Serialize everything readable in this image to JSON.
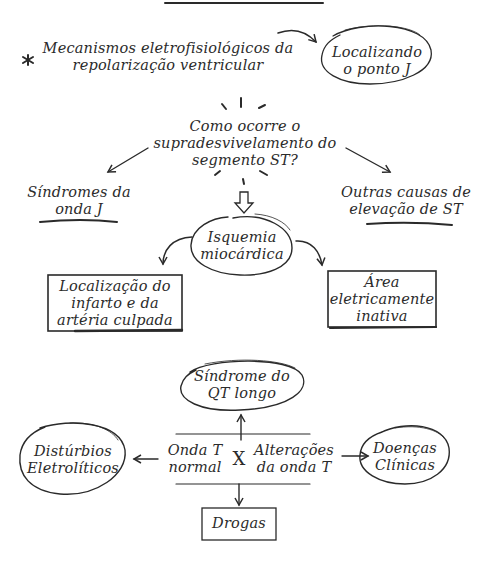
{
  "diagram": {
    "intro": {
      "bullet_icon": "asterisk-icon",
      "line1": "Mecanismos eletrofisiológicos da",
      "line2": "repolarização ventricular"
    },
    "locating_j": {
      "line1": "Localizando",
      "line2": "o ponto J"
    },
    "question": {
      "line1": "Como ocorre o",
      "line2": "supradesvivelamento do",
      "line3": "segmento ST?"
    },
    "j_wave": {
      "line1": "Síndromes da",
      "line2": "onda J"
    },
    "other_causes": {
      "line1": "Outras causas de",
      "line2": "elevação de ST"
    },
    "ischemia": {
      "line1": "Isquemia",
      "line2": "miocárdica"
    },
    "infarct_location": {
      "line1": "Localização do",
      "line2": "infarto e da",
      "line3": "artéria culpada"
    },
    "inactive_area": {
      "line1": "Área",
      "line2": "eletricamente",
      "line3": "inativa"
    },
    "long_qt": {
      "line1": "Síndrome do",
      "line2": "QT longo"
    },
    "normal_t": {
      "line1": "Onda T",
      "line2": "normal"
    },
    "versus": "X",
    "t_changes": {
      "line1": "Alterações",
      "line2": "da onda T"
    },
    "electrolytes": {
      "line1": "Distúrbios",
      "line2": "Eletrolíticos"
    },
    "clinical": {
      "line1": "Doenças",
      "line2": "Clínicas"
    },
    "drugs": "Drogas"
  }
}
